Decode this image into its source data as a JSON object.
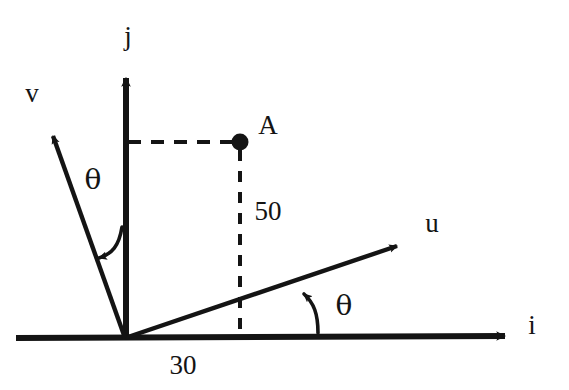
{
  "figure": {
    "background_color": "#ffffff",
    "ink_color": "#141414"
  },
  "axes": {
    "i": {
      "label": "i",
      "name": "horizontal-unit-vector",
      "label_x": 532,
      "label_y": 334
    },
    "j": {
      "label": "j",
      "name": "vertical-unit-vector",
      "label_x": 128,
      "label_y": 45
    }
  },
  "vectors": {
    "u": {
      "label": "u",
      "name": "rotated-axis-u",
      "label_x": 432,
      "label_y": 232
    },
    "v": {
      "label": "v",
      "name": "rotated-axis-v",
      "label_x": 24,
      "label_y": 102
    }
  },
  "point": {
    "label": "A",
    "name": "point-a",
    "label_x": 258,
    "label_y": 133,
    "marker_x": 240,
    "marker_y": 142,
    "marker_radius": 8
  },
  "dimensions": {
    "vertical": {
      "label": "50",
      "name": "vertical-component",
      "label_x": 252,
      "label_y": 220
    },
    "horizontal": {
      "label": "30",
      "name": "horizontal-component",
      "label_x": 163,
      "label_y": 372
    }
  },
  "angles": {
    "left": {
      "label": "θ",
      "name": "angle-theta-v-from-j",
      "label_x": 82,
      "label_y": 186
    },
    "right": {
      "label": "θ",
      "name": "angle-theta-u-from-i",
      "label_x": 332,
      "label_y": 317
    }
  },
  "geometry": {
    "origin": {
      "x": 125,
      "y": 338
    },
    "i_axis_end": {
      "x": 515,
      "y": 336
    },
    "j_axis_end": {
      "x": 126,
      "y": 66
    },
    "u_axis_end": {
      "x": 408,
      "y": 241
    },
    "v_axis_end": {
      "x": 45,
      "y": 126
    },
    "dashed_horizontal": {
      "x1": 128,
      "y1": 142,
      "x2": 238,
      "y2": 142
    },
    "dashed_vertical": {
      "x1": 240,
      "y1": 150,
      "x2": 240,
      "y2": 336
    }
  }
}
